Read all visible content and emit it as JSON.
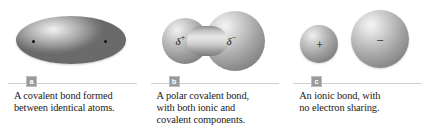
{
  "figure": {
    "panels": [
      {
        "badge": "a",
        "caption_lines": [
          "A covalent bond formed",
          "between identical atoms."
        ],
        "artwork": {
          "type": "shared-electron-cloud-ellipse",
          "electron_dots": 2,
          "labels": []
        }
      },
      {
        "badge": "b",
        "caption_lines": [
          "A polar covalent bond,",
          "with both ionic and",
          "covalent components."
        ],
        "artwork": {
          "type": "polar-dumbbell",
          "electron_dots": 0,
          "labels": [
            {
              "symbol": "δ",
              "charge": "+"
            },
            {
              "symbol": "δ",
              "charge": "−"
            }
          ]
        }
      },
      {
        "badge": "c",
        "caption_lines": [
          "An ionic bond, with",
          "no electron sharing."
        ],
        "artwork": {
          "type": "two-separate-ions",
          "electron_dots": 0,
          "labels": [
            {
              "symbol": "+",
              "charge": ""
            },
            {
              "symbol": "−",
              "charge": ""
            }
          ]
        }
      }
    ],
    "colors": {
      "background": "#ffffff",
      "badge_fill": "#9a9a9a",
      "badge_text": "#ffffff",
      "rule_line": "#cfcfcf",
      "caption_text": "#1a1a1a",
      "sphere_highlight": "#f4f4f4",
      "sphere_shadow": "#676767",
      "electron_dot": "#111111"
    }
  }
}
